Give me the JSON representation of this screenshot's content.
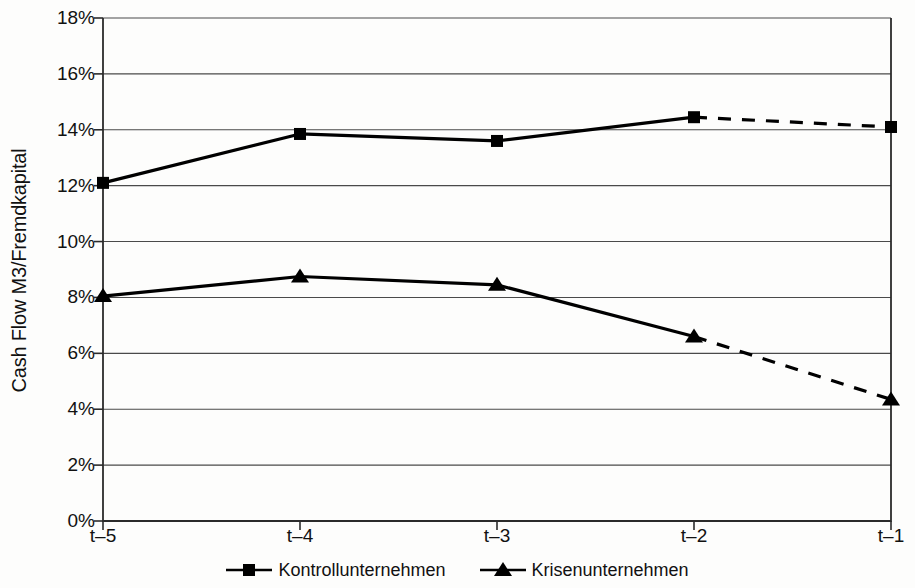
{
  "chart_data": {
    "type": "line",
    "title": "",
    "xlabel": "",
    "ylabel": "Cash Flow M3/Fremdkapital",
    "categories": [
      "t–5",
      "t–4",
      "t–3",
      "t–2",
      "t–1"
    ],
    "ylim": [
      0,
      18
    ],
    "ytick_values": [
      0,
      2,
      4,
      6,
      8,
      10,
      12,
      14,
      16,
      18
    ],
    "ytick_labels": [
      "0%",
      "2%",
      "4%",
      "6%",
      "8%",
      "10%",
      "12%",
      "14%",
      "16%",
      "18%"
    ],
    "grid": true,
    "legend_position": "bottom",
    "series": [
      {
        "name": "Kontrollunternehmen",
        "marker": "square",
        "color": "#000000",
        "values": [
          12.1,
          13.85,
          13.6,
          14.45,
          14.1
        ],
        "dashed_from_index": 3
      },
      {
        "name": "Krisenunternehmen",
        "marker": "triangle",
        "color": "#000000",
        "values": [
          8.05,
          8.75,
          8.45,
          6.6,
          4.35
        ],
        "dashed_from_index": 3
      }
    ]
  },
  "axis": {
    "y_title": "Cash Flow M3/Fremdkapital"
  },
  "legend": {
    "entries": [
      {
        "label": "Kontrollunternehmen",
        "marker": "square-marker"
      },
      {
        "label": "Krisenunternehmen",
        "marker": "triangle-marker"
      }
    ]
  },
  "colors": {
    "line": "#000000",
    "grid": "#4a4a4a",
    "axis": "#2b2b2b",
    "background": "#fdfdfc"
  }
}
